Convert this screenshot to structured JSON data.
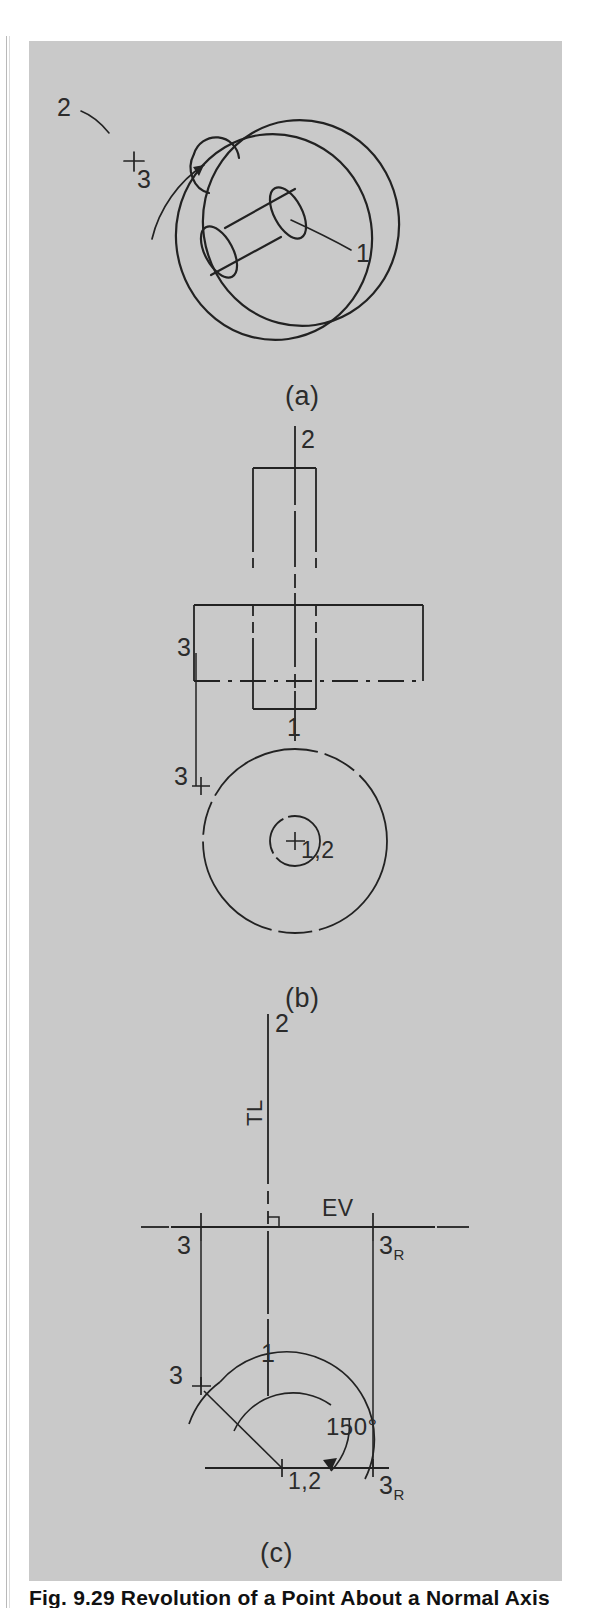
{
  "figure": {
    "type": "engineering-drawing",
    "caption": "Fig. 9.29  Revolution of a Point About a Normal Axis",
    "panels": [
      {
        "id": "a",
        "label": "(a)",
        "description": "Pictorial view of a disc rotating about a normal axis",
        "point_labels": [
          "2",
          "3",
          "1"
        ]
      },
      {
        "id": "b",
        "label": "(b)",
        "description": "Orthographic front and top views before revolution",
        "point_labels": [
          "2",
          "3",
          "1",
          "3",
          "1,2"
        ]
      },
      {
        "id": "c",
        "label": "(c)",
        "description": "Construction showing revolution of point 3 through 150 degrees",
        "point_labels": [
          "2",
          "3",
          "3R",
          "1",
          "3",
          "1,2",
          "3R"
        ],
        "annotations": [
          "TL",
          "EV",
          "150°"
        ]
      }
    ],
    "labels": {
      "one": "1",
      "two": "2",
      "three": "3",
      "three_r_base": "3",
      "three_r_sub": "R",
      "one_two": "1,2",
      "true_length": "TL",
      "edge_view": "EV",
      "angle": "150°"
    },
    "colors": {
      "plate_background": "#c9c9c9",
      "line": "#222222",
      "page_background": "#ffffff",
      "rule": "#b9b9b9"
    }
  }
}
